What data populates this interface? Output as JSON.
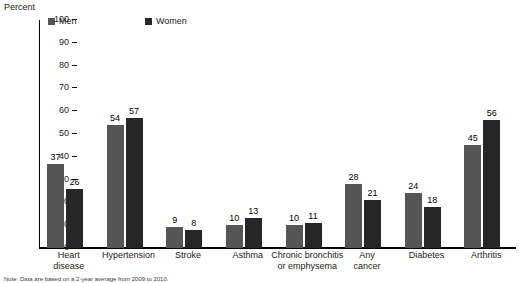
{
  "chart_data": {
    "type": "bar",
    "title": "",
    "ylabel": "Percent",
    "xlabel": "",
    "ylim": [
      0,
      100
    ],
    "yticks": [
      0,
      10,
      20,
      30,
      40,
      50,
      60,
      70,
      80,
      90,
      100
    ],
    "grid": false,
    "legend_position": "top-left",
    "categories": [
      "Heart disease",
      "Hypertension",
      "Stroke",
      "Asthma",
      "Chronic bronchitis or emphysema",
      "Any cancer",
      "Diabetes",
      "Arthritis"
    ],
    "category_lines": [
      [
        "Heart",
        "disease"
      ],
      [
        "Hypertension"
      ],
      [
        "Stroke"
      ],
      [
        "Asthma"
      ],
      [
        "Chronic bronchitis",
        "or emphysema"
      ],
      [
        "Any",
        "cancer"
      ],
      [
        "Diabetes"
      ],
      [
        "Arthritis"
      ]
    ],
    "series": [
      {
        "name": "Men",
        "color": "#555555",
        "values": [
          37,
          54,
          9,
          10,
          10,
          28,
          24,
          45
        ]
      },
      {
        "name": "Women",
        "color": "#262626",
        "values": [
          26,
          57,
          8,
          13,
          11,
          21,
          18,
          56
        ]
      }
    ]
  },
  "footnote": "Note: Data are based on a 2-year average from 2009 to 2010."
}
